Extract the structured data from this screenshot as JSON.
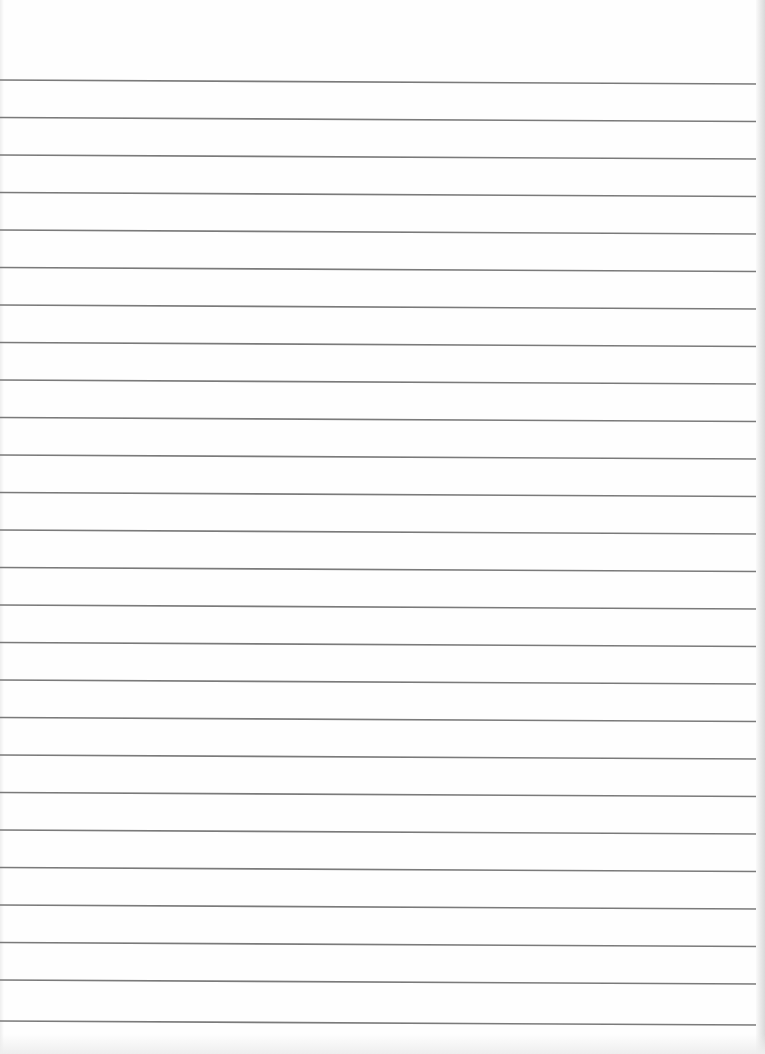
{
  "page": {
    "type": "lined-paper",
    "width": 765,
    "height": 1054,
    "background_color": "#fefefe",
    "line_color": "#7a7a7a",
    "line_width": 1.6,
    "line_count": 26,
    "line_start_x": 0,
    "line_end_x": 758,
    "line_slope_px": 4,
    "line_y_positions": [
      80,
      117.5,
      155,
      192.5,
      230,
      267.5,
      305,
      342.5,
      380,
      417.5,
      455,
      492.5,
      530,
      567.5,
      605,
      642.5,
      680,
      717.5,
      755,
      792.5,
      830,
      867.5,
      905,
      942.5,
      980,
      1021
    ]
  }
}
